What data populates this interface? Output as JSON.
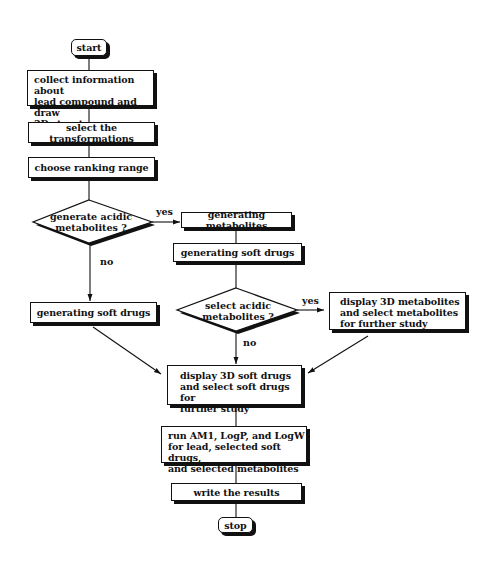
{
  "diagram": {
    "type": "flowchart",
    "nodes": {
      "start": {
        "label": "start",
        "shape": "terminator"
      },
      "collect": {
        "label": "collect information about\nlead compound and draw\n3D structure",
        "shape": "process"
      },
      "select_transformations": {
        "label": "select the transformations",
        "shape": "process"
      },
      "choose_ranking": {
        "label": "choose ranking range",
        "shape": "process"
      },
      "decision_generate_acidic": {
        "label": "generate acidic\nmetabolites ?",
        "shape": "decision"
      },
      "generating_metabolites": {
        "label": "generating metabolites",
        "shape": "process"
      },
      "generating_soft_drugs_right": {
        "label": "generating soft drugs",
        "shape": "process"
      },
      "generating_soft_drugs_left": {
        "label": "generating soft drugs",
        "shape": "process"
      },
      "decision_select_acidic": {
        "label": "select acidic\nmetabolites ?",
        "shape": "decision"
      },
      "display_metabolites": {
        "label": "display 3D metabolites\nand select metabolites\nfor further study",
        "shape": "process"
      },
      "display_soft_drugs": {
        "label": "display 3D soft drugs\nand select soft drugs for\nfurther study",
        "shape": "process"
      },
      "run_calculations": {
        "label": "run AM1, LogP, and LogW\nfor lead, selected soft drugs,\nand selected metabolites",
        "shape": "process"
      },
      "write_results": {
        "label": "write the results",
        "shape": "process"
      },
      "stop": {
        "label": "stop",
        "shape": "terminator"
      }
    },
    "edges": [
      {
        "from": "start",
        "to": "collect",
        "label": ""
      },
      {
        "from": "collect",
        "to": "select_transformations",
        "label": ""
      },
      {
        "from": "select_transformations",
        "to": "choose_ranking",
        "label": ""
      },
      {
        "from": "choose_ranking",
        "to": "decision_generate_acidic",
        "label": ""
      },
      {
        "from": "decision_generate_acidic",
        "to": "generating_metabolites",
        "label": "yes"
      },
      {
        "from": "decision_generate_acidic",
        "to": "generating_soft_drugs_left",
        "label": "no"
      },
      {
        "from": "generating_metabolites",
        "to": "generating_soft_drugs_right",
        "label": ""
      },
      {
        "from": "generating_soft_drugs_right",
        "to": "decision_select_acidic",
        "label": ""
      },
      {
        "from": "decision_select_acidic",
        "to": "display_metabolites",
        "label": "yes"
      },
      {
        "from": "decision_select_acidic",
        "to": "display_soft_drugs",
        "label": "no"
      },
      {
        "from": "generating_soft_drugs_left",
        "to": "display_soft_drugs",
        "label": ""
      },
      {
        "from": "display_metabolites",
        "to": "display_soft_drugs",
        "label": ""
      },
      {
        "from": "display_soft_drugs",
        "to": "run_calculations",
        "label": ""
      },
      {
        "from": "run_calculations",
        "to": "write_results",
        "label": ""
      },
      {
        "from": "write_results",
        "to": "stop",
        "label": ""
      }
    ],
    "edge_labels": {
      "yes_1": "yes",
      "no_1": "no",
      "yes_2": "yes",
      "no_2": "no"
    }
  }
}
